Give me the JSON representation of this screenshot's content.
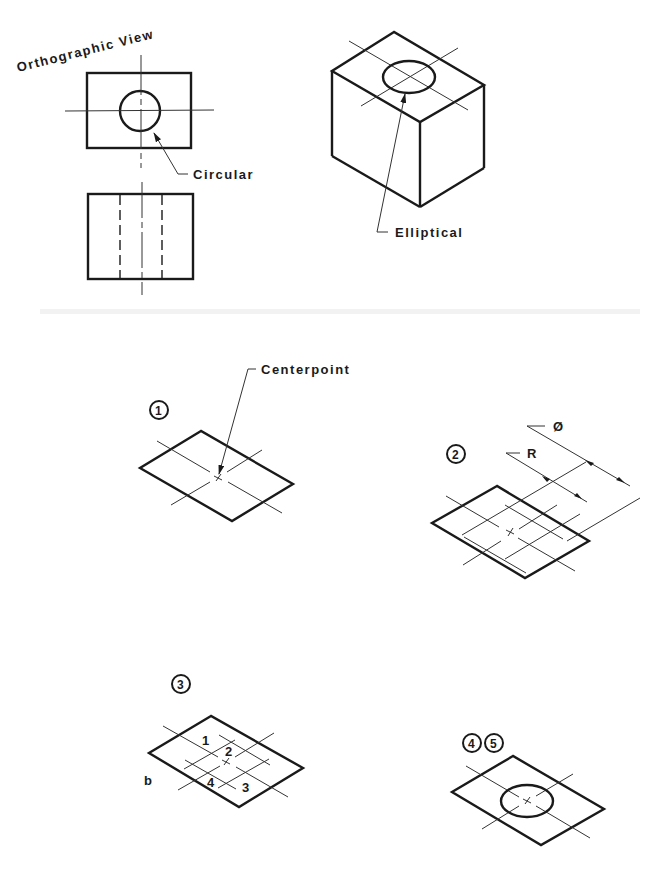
{
  "figure": {
    "top_left": {
      "title": "Orthographic View",
      "callout": "Circular"
    },
    "top_right": {
      "callout": "Elliptical"
    },
    "steps": [
      {
        "id": "step-1",
        "marker": "1",
        "callout": "Centerpoint"
      },
      {
        "id": "step-2",
        "marker": "2",
        "dimension_labels": [
          "Ø",
          "R"
        ]
      },
      {
        "id": "step-3",
        "marker": "3",
        "arc_numbers": [
          "1",
          "2",
          "3",
          "4"
        ],
        "side_label": "b"
      },
      {
        "id": "step-4-5",
        "markers": [
          "4",
          "5"
        ]
      }
    ]
  },
  "colors": {
    "ink": "#1a1a1a",
    "background": "#ffffff"
  }
}
